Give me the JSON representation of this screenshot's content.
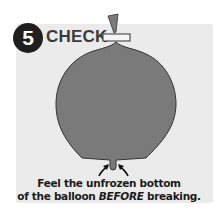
{
  "step": {
    "number": "5",
    "title": "CHECK"
  },
  "caption": {
    "line1": "Feel the unfrozen bottom",
    "line2_prefix": "of the balloon ",
    "line2_emphasis": "BEFORE",
    "line2_suffix": " breaking."
  },
  "colors": {
    "panel": "#ebebeb",
    "badge": "#1f1f1f",
    "balloon": "#7a7a7a",
    "balloon_outline": "#333333"
  }
}
